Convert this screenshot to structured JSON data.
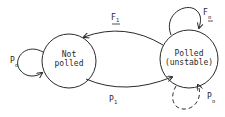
{
  "diagram": {
    "type": "state-transition",
    "states": [
      {
        "id": "not_polled",
        "line1": "Not",
        "line2": "polled"
      },
      {
        "id": "polled_unstable",
        "line1": "Polled",
        "line2": "(unstable)"
      }
    ],
    "transitions": [
      {
        "from": "polled_unstable",
        "to": "not_polled",
        "label_main": "F",
        "label_sub": "1",
        "underlined": true,
        "style": "solid"
      },
      {
        "from": "not_polled",
        "to": "polled_unstable",
        "label_main": "P",
        "label_sub": "1",
        "style": "solid"
      },
      {
        "from": "not_polled",
        "to": "not_polled",
        "label_main": "P",
        "label_sub": "o",
        "style": "solid"
      },
      {
        "from": "polled_unstable",
        "to": "polled_unstable",
        "label_main": "F",
        "label_sub": "o",
        "underlined": true,
        "style": "solid"
      },
      {
        "from": "polled_unstable",
        "to": "polled_unstable",
        "label_main": "P",
        "label_sub": "o",
        "style": "dashed"
      }
    ]
  }
}
